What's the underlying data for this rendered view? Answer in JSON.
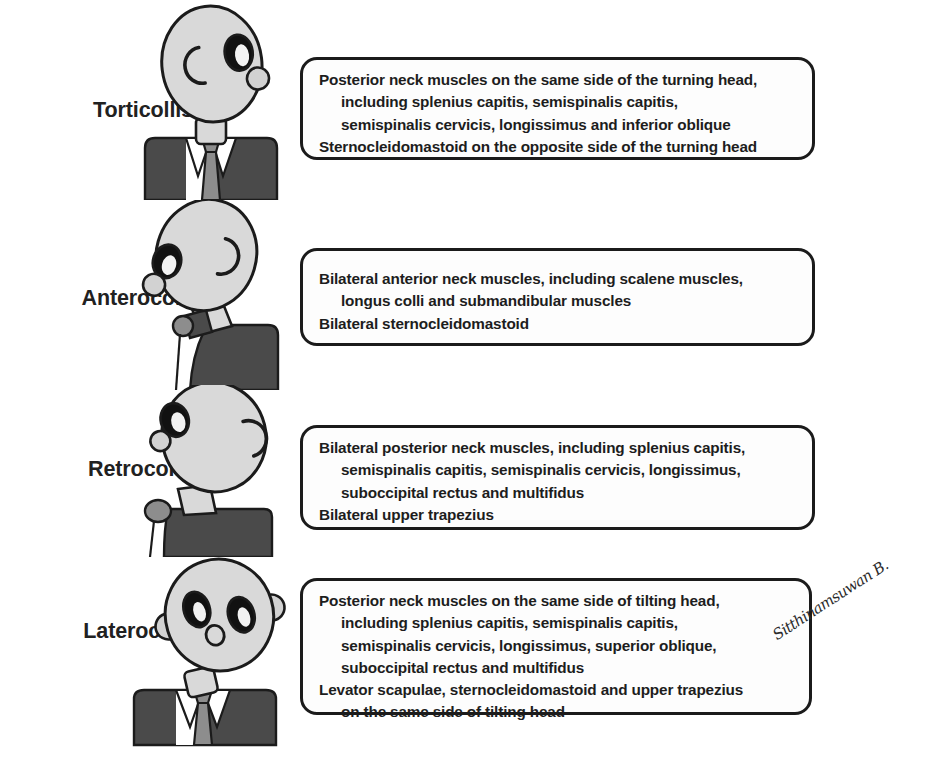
{
  "figure": {
    "signature": "Sitthinamsuwan B.",
    "colors": {
      "outline": "#1b1b1b",
      "head_fill": "#d9d9d9",
      "suit_fill": "#4a4a4a",
      "tie_fill": "#8d8d8d",
      "shirt_fill": "#ffffff",
      "eye_fill": "#111111",
      "eye_highlight": "#f2f2f2",
      "ear_fill": "#d2d2d2",
      "text": "#1d1d1d",
      "background": "#ffffff"
    }
  },
  "rows": [
    {
      "label": "Torticollis",
      "figure_name": "torticollis-figure",
      "lines": [
        {
          "text": "Posterior neck muscles on the same side of the turning head,",
          "indent": false
        },
        {
          "text": "including splenius capitis, semispinalis capitis,",
          "indent": true
        },
        {
          "text": "semispinalis cervicis, longissimus and inferior oblique",
          "indent": true
        },
        {
          "text": "Sternocleidomastoid on the opposite side of the turning head",
          "indent": false
        }
      ]
    },
    {
      "label": "Anterocollis",
      "figure_name": "anterocollis-figure",
      "lines": [
        {
          "text": "Bilateral anterior neck muscles, including scalene muscles,",
          "indent": false
        },
        {
          "text": "longus colli and submandibular muscles",
          "indent": true
        },
        {
          "text": "Bilateral sternocleidomastoid",
          "indent": false
        }
      ]
    },
    {
      "label": "Retrocollis",
      "figure_name": "retrocollis-figure",
      "lines": [
        {
          "text": "Bilateral posterior neck muscles, including splenius capitis,",
          "indent": false
        },
        {
          "text": "semispinalis capitis, semispinalis cervicis, longissimus,",
          "indent": true
        },
        {
          "text": "suboccipital rectus and multifidus",
          "indent": true
        },
        {
          "text": "Bilateral upper trapezius",
          "indent": false
        }
      ]
    },
    {
      "label": "Laterocollis",
      "figure_name": "laterocollis-figure",
      "lines": [
        {
          "text": "Posterior neck muscles on the same side of tilting head,",
          "indent": false
        },
        {
          "text": "including splenius capitis, semispinalis capitis,",
          "indent": true
        },
        {
          "text": "semispinalis cervicis, longissimus, superior oblique,",
          "indent": true
        },
        {
          "text": "suboccipital rectus and multifidus",
          "indent": true
        },
        {
          "text": "Levator scapulae, sternocleidomastoid and upper trapezius",
          "indent": false
        },
        {
          "text": "on the same side of tilting head",
          "indent": true
        }
      ]
    }
  ]
}
